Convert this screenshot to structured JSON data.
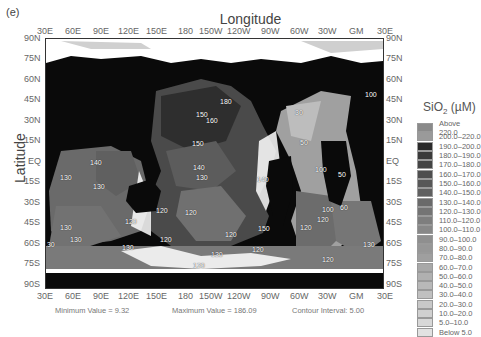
{
  "panel_label": "(e)",
  "axes": {
    "x_title": "Longitude",
    "y_title": "Latitude",
    "x_ticks": [
      "30E",
      "60E",
      "90E",
      "120E",
      "150E",
      "180",
      "150W",
      "120W",
      "90W",
      "60W",
      "30W",
      "GM",
      "30E"
    ],
    "y_ticks": [
      "90N",
      "75N",
      "60N",
      "45N",
      "30N",
      "15N",
      "EQ",
      "15S",
      "30S",
      "45S",
      "60S",
      "75S",
      "90S"
    ]
  },
  "legend": {
    "title": "SiO",
    "title_sub": "2",
    "title_unit": " (µM)",
    "items": [
      {
        "label": "Above 220.0",
        "color": "#8a8a8a"
      },
      {
        "label": "200.0–220.0",
        "color": "#9a9a9a"
      },
      {
        "label": "190.0–200.0",
        "color": "#2a2a2a"
      },
      {
        "label": "180.0–190.0",
        "color": "#3a3a3a"
      },
      {
        "label": "170.0–180.0",
        "color": "#444444"
      },
      {
        "label": "160.0–170.0",
        "color": "#4e4e4e"
      },
      {
        "label": "150.0–160.0",
        "color": "#575757"
      },
      {
        "label": "140.0–150.0",
        "color": "#606060"
      },
      {
        "label": "130.0–140.0",
        "color": "#6a6a6a"
      },
      {
        "label": "120.0–130.0",
        "color": "#747474"
      },
      {
        "label": "110.0–120.0",
        "color": "#7e7e7e"
      },
      {
        "label": "100.0–110.0",
        "color": "#888888"
      },
      {
        "label": "90.0–100.0",
        "color": "#8f8f8f"
      },
      {
        "label": "80.0–90.0",
        "color": "#979797"
      },
      {
        "label": "70.0–80.0",
        "color": "#9f9f9f"
      },
      {
        "label": "60.0–70.0",
        "color": "#a8a8a8"
      },
      {
        "label": "50.0–60.0",
        "color": "#b0b0b0"
      },
      {
        "label": "40.0–50.0",
        "color": "#b8b8b8"
      },
      {
        "label": "30.0–40.0",
        "color": "#c0c0c0"
      },
      {
        "label": "20.0–30.0",
        "color": "#c8c8c8"
      },
      {
        "label": "10.0–20.0",
        "color": "#d0d0d0"
      },
      {
        "label": "5.0–10.0",
        "color": "#d8d8d8"
      },
      {
        "label": "Below 5.0",
        "color": "#e2e2e2"
      }
    ]
  },
  "footer": {
    "minimum": "Minimum Value = 9.32",
    "maximum": "Maximum Value = 186.09",
    "contour": "Contour Interval: 5.00"
  },
  "contour_labels": [
    {
      "text": "180",
      "x": 225,
      "y": 102
    },
    {
      "text": "150",
      "x": 201,
      "y": 115
    },
    {
      "text": "160",
      "x": 211,
      "y": 121
    },
    {
      "text": "150",
      "x": 197,
      "y": 144
    },
    {
      "text": "140",
      "x": 198,
      "y": 168
    },
    {
      "text": "130",
      "x": 201,
      "y": 178
    },
    {
      "text": "140",
      "x": 262,
      "y": 180
    },
    {
      "text": "140",
      "x": 95,
      "y": 163
    },
    {
      "text": "130",
      "x": 65,
      "y": 178
    },
    {
      "text": "130",
      "x": 98,
      "y": 187
    },
    {
      "text": "130",
      "x": 65,
      "y": 228
    },
    {
      "text": "120",
      "x": 130,
      "y": 222
    },
    {
      "text": "130",
      "x": 75,
      "y": 240
    },
    {
      "text": "130",
      "x": 48,
      "y": 245
    },
    {
      "text": "120",
      "x": 190,
      "y": 213
    },
    {
      "text": "120",
      "x": 161,
      "y": 211
    },
    {
      "text": "120",
      "x": 230,
      "y": 235
    },
    {
      "text": "130",
      "x": 127,
      "y": 248
    },
    {
      "text": "120",
      "x": 165,
      "y": 240
    },
    {
      "text": "150",
      "x": 263,
      "y": 229
    },
    {
      "text": "120",
      "x": 257,
      "y": 250
    },
    {
      "text": "130",
      "x": 216,
      "y": 255
    },
    {
      "text": "120",
      "x": 198,
      "y": 266
    },
    {
      "text": "30",
      "x": 300,
      "y": 113
    },
    {
      "text": "50",
      "x": 305,
      "y": 143
    },
    {
      "text": "100",
      "x": 320,
      "y": 170
    },
    {
      "text": "100",
      "x": 327,
      "y": 210
    },
    {
      "text": "50",
      "x": 343,
      "y": 175
    },
    {
      "text": "60",
      "x": 345,
      "y": 208
    },
    {
      "text": "120",
      "x": 322,
      "y": 220
    },
    {
      "text": "120",
      "x": 305,
      "y": 228
    },
    {
      "text": "120",
      "x": 327,
      "y": 260
    },
    {
      "text": "130",
      "x": 368,
      "y": 245
    },
    {
      "text": "100",
      "x": 370,
      "y": 95
    }
  ]
}
